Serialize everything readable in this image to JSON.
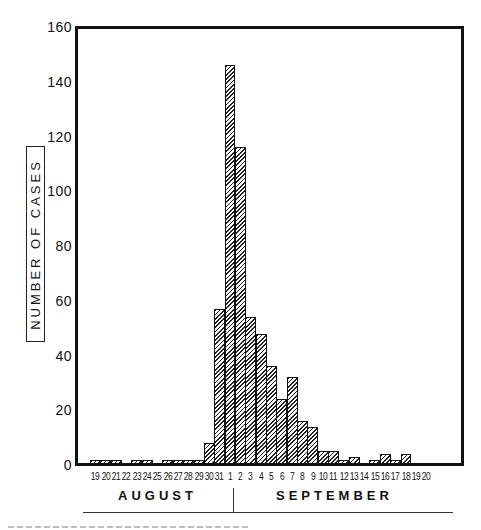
{
  "chart_data": {
    "type": "bar",
    "title": "",
    "xlabel": "",
    "ylabel": "NUMBER OF CASES",
    "ylim": [
      0,
      160
    ],
    "yticks": [
      0,
      20,
      40,
      60,
      80,
      100,
      120,
      140,
      160
    ],
    "grid": false,
    "legend": null,
    "month_labels": [
      "AUGUST",
      "SEPTEMBER"
    ],
    "categories": [
      "Aug 19",
      "Aug 20",
      "Aug 21",
      "Aug 22",
      "Aug 23",
      "Aug 24",
      "Aug 25",
      "Aug 26",
      "Aug 27",
      "Aug 28",
      "Aug 29",
      "Aug 30",
      "Aug 31",
      "Sep 1",
      "Sep 2",
      "Sep 3",
      "Sep 4",
      "Sep 5",
      "Sep 6",
      "Sep 7",
      "Sep 8",
      "Sep 9",
      "Sep 10",
      "Sep 11",
      "Sep 12",
      "Sep 13",
      "Sep 14",
      "Sep 15",
      "Sep 16",
      "Sep 17",
      "Sep 18",
      "Sep 19",
      "Sep 20"
    ],
    "tick_labels": [
      "19",
      "20",
      "21",
      "22",
      "23",
      "24",
      "25",
      "26",
      "27",
      "28",
      "29",
      "30",
      "31",
      "1",
      "2",
      "3",
      "4",
      "5",
      "6",
      "7",
      "8",
      "9",
      "10",
      "11",
      "12",
      "13",
      "14",
      "15",
      "16",
      "17",
      "18",
      "19",
      "20"
    ],
    "values": [
      2,
      2,
      2,
      0,
      2,
      2,
      0,
      2,
      2,
      2,
      2,
      8,
      57,
      146,
      116,
      54,
      48,
      36,
      24,
      32,
      16,
      14,
      5,
      5,
      2,
      3,
      0,
      2,
      4,
      2,
      4,
      0,
      0
    ]
  },
  "y_axis": {
    "label": "NUMBER OF CASES",
    "ticks": [
      "160",
      "140",
      "120",
      "100",
      "80",
      "60",
      "40",
      "20",
      "0"
    ]
  },
  "months": {
    "first": "AUGUST",
    "second": "SEPTEMBER"
  }
}
